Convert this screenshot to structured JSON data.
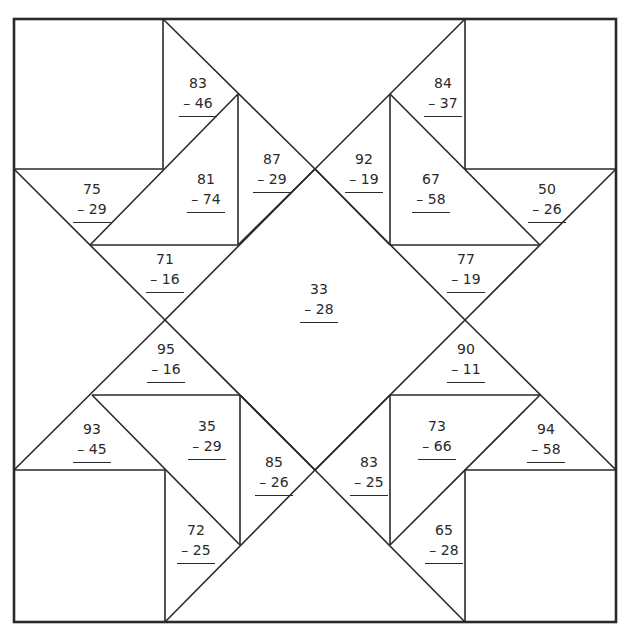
{
  "worksheet": {
    "title": "Subtraction quilt block",
    "problems": [
      {
        "id": "p1",
        "minuend": "83",
        "subtrahend": "– 46",
        "x": 198,
        "y": 73
      },
      {
        "id": "p2",
        "minuend": "84",
        "subtrahend": "– 37",
        "x": 443,
        "y": 73
      },
      {
        "id": "p3",
        "minuend": "75",
        "subtrahend": "– 29",
        "x": 92,
        "y": 179
      },
      {
        "id": "p4",
        "minuend": "81",
        "subtrahend": "– 74",
        "x": 206,
        "y": 169
      },
      {
        "id": "p5",
        "minuend": "87",
        "subtrahend": "– 29",
        "x": 272,
        "y": 149
      },
      {
        "id": "p6",
        "minuend": "92",
        "subtrahend": "– 19",
        "x": 364,
        "y": 149
      },
      {
        "id": "p7",
        "minuend": "67",
        "subtrahend": "– 58",
        "x": 431,
        "y": 169
      },
      {
        "id": "p8",
        "minuend": "50",
        "subtrahend": "– 26",
        "x": 547,
        "y": 179
      },
      {
        "id": "p9",
        "minuend": "71",
        "subtrahend": "– 16",
        "x": 165,
        "y": 249
      },
      {
        "id": "p10",
        "minuend": "77",
        "subtrahend": "– 19",
        "x": 466,
        "y": 249
      },
      {
        "id": "p11",
        "minuend": "33",
        "subtrahend": "– 28",
        "x": 319,
        "y": 279
      },
      {
        "id": "p12",
        "minuend": "95",
        "subtrahend": "– 16",
        "x": 166,
        "y": 339
      },
      {
        "id": "p13",
        "minuend": "90",
        "subtrahend": "– 11",
        "x": 466,
        "y": 339
      },
      {
        "id": "p14",
        "minuend": "93",
        "subtrahend": "– 45",
        "x": 92,
        "y": 419
      },
      {
        "id": "p15",
        "minuend": "35",
        "subtrahend": "– 29",
        "x": 207,
        "y": 416
      },
      {
        "id": "p16",
        "minuend": "85",
        "subtrahend": "– 26",
        "x": 274,
        "y": 452
      },
      {
        "id": "p17",
        "minuend": "83",
        "subtrahend": "– 25",
        "x": 369,
        "y": 452
      },
      {
        "id": "p18",
        "minuend": "73",
        "subtrahend": "– 66",
        "x": 437,
        "y": 416
      },
      {
        "id": "p19",
        "minuend": "94",
        "subtrahend": "– 58",
        "x": 546,
        "y": 419
      },
      {
        "id": "p20",
        "minuend": "72",
        "subtrahend": "– 25",
        "x": 196,
        "y": 520
      },
      {
        "id": "p21",
        "minuend": "65",
        "subtrahend": "– 28",
        "x": 444,
        "y": 520
      }
    ]
  },
  "colors": {
    "ink": "#2a2a2a",
    "paper": "#ffffff"
  }
}
